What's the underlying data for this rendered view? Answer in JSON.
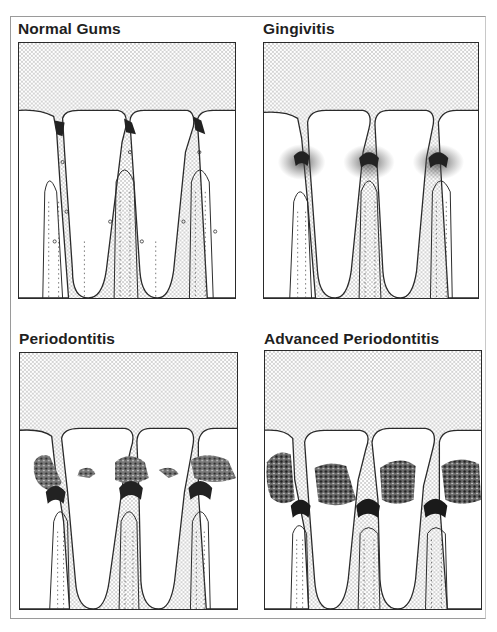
{
  "figure": {
    "type": "four-panel dental illustration",
    "background_color": "#ffffff",
    "line_color": "#2a2a2a",
    "stipple_color": "#9a9a9a"
  },
  "panels": [
    {
      "id": "normal-gums",
      "title": "Normal Gums",
      "position": "top-left",
      "stage": 0,
      "features": [
        "stippled gum tissue above teeth",
        "three teeth with narrow interdental papillae",
        "dark small pockets at gumline",
        "roots with bone and periodontal ligament",
        "dotted bone lines"
      ]
    },
    {
      "id": "gingivitis",
      "title": "Gingivitis",
      "position": "top-right",
      "stage": 1,
      "features": [
        "diffuse speckled inflammation around gumline",
        "darkened inflamed papillae",
        "roots intact"
      ]
    },
    {
      "id": "periodontitis",
      "title": "Periodontitis",
      "position": "bottom-left",
      "stage": 2,
      "features": [
        "plaque/tartar buildup (calculus) along gumline",
        "deepened pockets",
        "dark inflamed tissue above roots"
      ]
    },
    {
      "id": "advanced-periodontitis",
      "title": "Advanced Periodontitis",
      "position": "bottom-right",
      "stage": 3,
      "features": [
        "heavy calculus deposits between teeth",
        "receded gum and bone",
        "flattened bone crest",
        "deep dark pockets"
      ]
    }
  ]
}
